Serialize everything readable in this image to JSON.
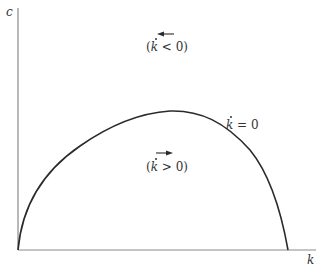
{
  "diagram": {
    "axes": {
      "y_label": "c",
      "x_label": "k"
    },
    "curve": {
      "label_var": "k",
      "label_rest": " = 0"
    },
    "regions": {
      "upper": {
        "open": "(",
        "var": "k",
        "rest": " < 0)",
        "arrow_direction": "left"
      },
      "lower": {
        "open": "(",
        "var": "k",
        "rest": " > 0)",
        "arrow_direction": "right"
      }
    },
    "colors": {
      "axis": "#8a8a8a",
      "curve": "#2a2a2a",
      "text": "#333333",
      "background": "#ffffff"
    }
  }
}
